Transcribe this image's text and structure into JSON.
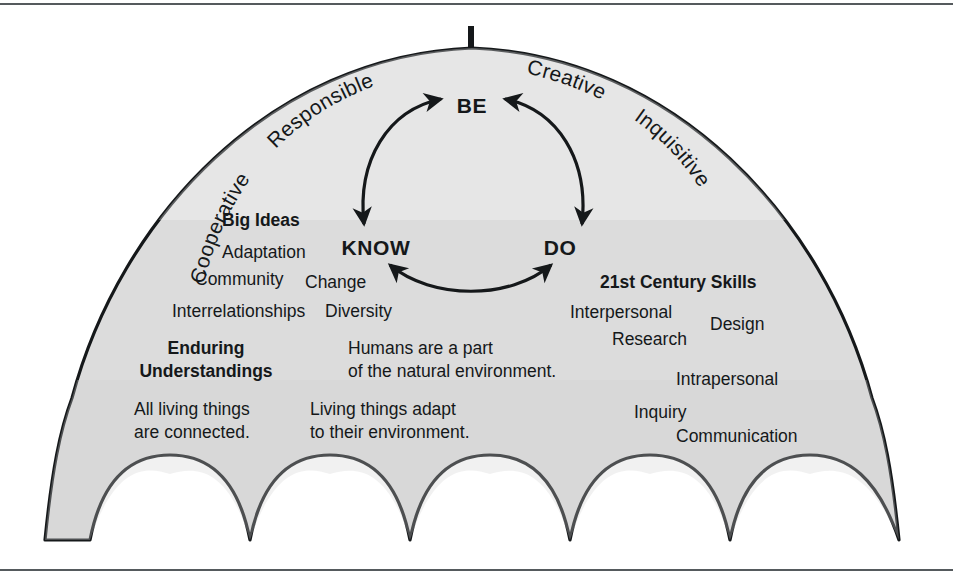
{
  "figure": {
    "canopy_fill": "#dcdcdc",
    "outline_color": "#15181a",
    "frame_color": "#555a5d"
  },
  "canopy_edge_words": [
    {
      "id": "cooperative",
      "label": "Cooperative"
    },
    {
      "id": "responsible",
      "label": "Responsible"
    },
    {
      "id": "creative",
      "label": "Creative"
    },
    {
      "id": "inquisitive",
      "label": "Inquisitive"
    }
  ],
  "cycle": {
    "nodes": [
      {
        "id": "be",
        "label": "BE",
        "x": 472,
        "y": 105
      },
      {
        "id": "know",
        "label": "KNOW",
        "x": 376,
        "y": 247
      },
      {
        "id": "do",
        "label": "DO",
        "x": 560,
        "y": 247
      }
    ],
    "arrows": [
      {
        "id": "be-know",
        "from": "BE",
        "to": "KNOW",
        "double_headed": true
      },
      {
        "id": "be-do",
        "from": "BE",
        "to": "DO",
        "double_headed": true
      },
      {
        "id": "know-do",
        "from": "KNOW",
        "to": "DO",
        "double_headed": true
      }
    ]
  },
  "big_ideas": {
    "heading": "Big Ideas",
    "items": [
      {
        "label": "Adaptation",
        "x": 222,
        "y": 258
      },
      {
        "label": "Community",
        "x": 195,
        "y": 285
      },
      {
        "label": "Change",
        "x": 305,
        "y": 288
      },
      {
        "label": "Interrelationships",
        "x": 172,
        "y": 317
      },
      {
        "label": "Diversity",
        "x": 325,
        "y": 317
      }
    ],
    "heading_pos": {
      "x": 222,
      "y": 226
    }
  },
  "skills": {
    "heading": "21st Century Skills",
    "items": [
      {
        "label": "Interpersonal",
        "x": 570,
        "y": 318
      },
      {
        "label": "Research",
        "x": 612,
        "y": 345
      },
      {
        "label": "Design",
        "x": 710,
        "y": 330
      },
      {
        "label": "Intrapersonal",
        "x": 676,
        "y": 385
      },
      {
        "label": "Inquiry",
        "x": 634,
        "y": 418
      },
      {
        "label": "Communication",
        "x": 676,
        "y": 442
      }
    ],
    "heading_pos": {
      "x": 600,
      "y": 288
    }
  },
  "enduring": {
    "heading_line1": "Enduring",
    "heading_line2": "Understandings",
    "heading_pos": {
      "x": 206,
      "y": 354
    },
    "statements": [
      {
        "id": "statement-humans",
        "line1": "Humans are a part",
        "line2": "of the natural environment.",
        "x": 348,
        "y": 354
      },
      {
        "id": "statement-connected",
        "line1": "All living things",
        "line2": "are connected.",
        "x": 134,
        "y": 415
      },
      {
        "id": "statement-adapt",
        "line1": "Living things adapt",
        "line2": "to their environment.",
        "x": 310,
        "y": 415
      }
    ]
  }
}
